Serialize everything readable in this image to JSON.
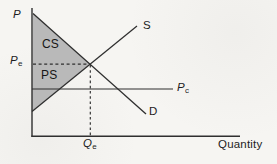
{
  "figure": {
    "axes": {
      "y_axis_label": "P",
      "x_axis_label": "Quantity"
    },
    "curves": {
      "supply_label": "S",
      "demand_label": "D"
    },
    "regions": {
      "consumer_surplus_label": "CS",
      "producer_surplus_label": "PS"
    },
    "price_quantity_labels": {
      "equilibrium_price": {
        "base": "P",
        "sub": "e"
      },
      "price_c": {
        "base": "P",
        "sub": "c"
      },
      "equilibrium_quantity": {
        "base": "Q",
        "sub": "e"
      }
    },
    "colors": {
      "surplus_fill": "#b9b9b9",
      "line": "#2f2f2f",
      "text": "#1d1d1d",
      "background": "#f6f5f2"
    }
  }
}
